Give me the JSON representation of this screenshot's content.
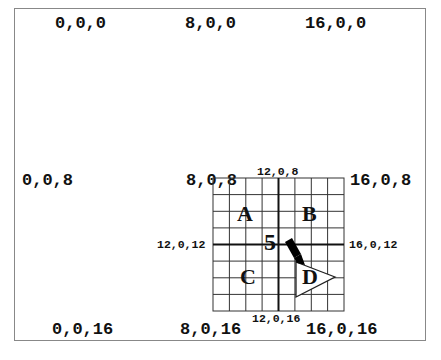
{
  "diagram": {
    "corner_labels": {
      "top_left": "0,0,0",
      "top_mid": "8,0,0",
      "top_right": "16,0,0",
      "mid_left": "0,0,8",
      "mid_mid": "8,0,8",
      "mid_right": "16,0,8",
      "bot_left": "0,0,16",
      "bot_mid": "8,0,16",
      "bot_right": "16,0,16"
    },
    "subgrid_labels": {
      "top": "12,0,8",
      "left": "12,0,12",
      "right": "16,0,12",
      "bottom": "12,0,16"
    },
    "quadrants": [
      "A",
      "B",
      "C",
      "D"
    ],
    "marker_number": "5",
    "grid": {
      "cells": 8,
      "divisions": 2
    }
  }
}
